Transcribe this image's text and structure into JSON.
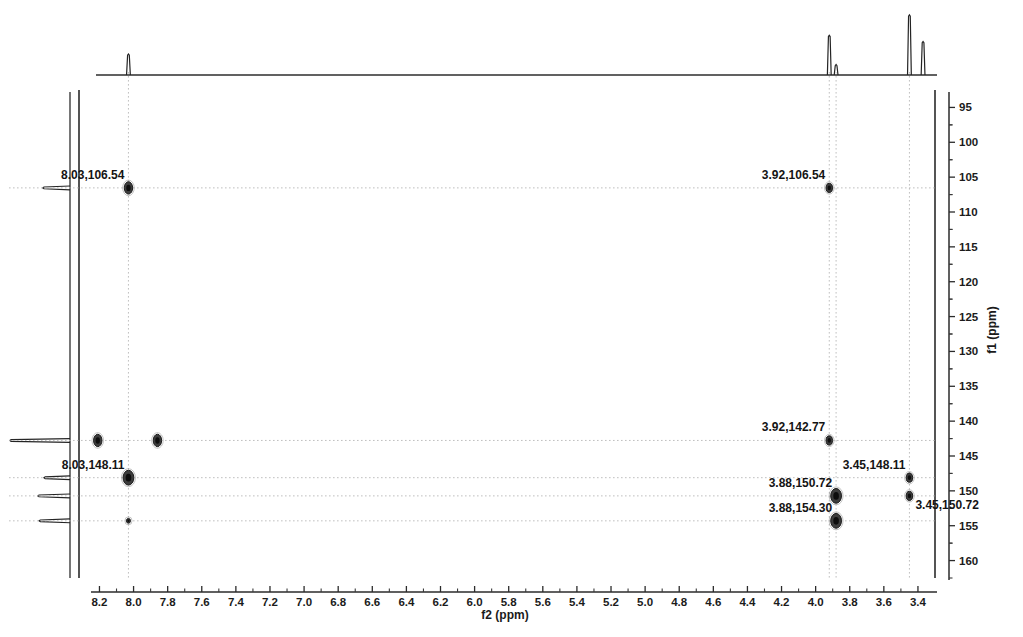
{
  "chart_data": {
    "type": "scatter",
    "title": "",
    "subtitle": "",
    "xlabel": "f2 (ppm)",
    "ylabel": "f1 (ppm)",
    "xlim": [
      8.32,
      3.3
    ],
    "ylim": [
      92.5,
      162.5
    ],
    "x_axis_direction": "reversed",
    "y_axis_direction": "reversed",
    "grid": "dotted crosshair guides at labeled peaks",
    "legend": "none",
    "x_ticks": [
      "8.2",
      "8.0",
      "7.8",
      "7.6",
      "7.4",
      "7.2",
      "7.0",
      "6.8",
      "6.6",
      "6.4",
      "6.2",
      "6.0",
      "5.8",
      "5.6",
      "5.4",
      "5.2",
      "5.0",
      "4.8",
      "4.6",
      "4.4",
      "4.2",
      "4.0",
      "3.8",
      "3.6",
      "3.4"
    ],
    "x_tick_values": [
      8.2,
      8.0,
      7.8,
      7.6,
      7.4,
      7.2,
      7.0,
      6.8,
      6.6,
      6.4,
      6.2,
      6.0,
      5.8,
      5.6,
      5.4,
      5.2,
      5.0,
      4.8,
      4.6,
      4.4,
      4.2,
      4.0,
      3.8,
      3.6,
      3.4
    ],
    "y_ticks": [
      "95",
      "100",
      "105",
      "110",
      "115",
      "120",
      "125",
      "130",
      "135",
      "140",
      "145",
      "150",
      "155",
      "160"
    ],
    "y_tick_values": [
      95,
      100,
      105,
      110,
      115,
      120,
      125,
      130,
      135,
      140,
      145,
      150,
      155,
      160
    ],
    "points": [
      {
        "x": 8.03,
        "y": 106.54,
        "label": "8.03,106.54",
        "label_side": "left-above",
        "size": "medium",
        "labeled": true
      },
      {
        "x": 3.92,
        "y": 106.54,
        "label": "3.92,106.54",
        "label_side": "left-above",
        "size": "small",
        "labeled": true
      },
      {
        "x": 8.21,
        "y": 142.77,
        "label": "",
        "label_side": "none",
        "size": "medium",
        "labeled": false
      },
      {
        "x": 7.86,
        "y": 142.77,
        "label": "",
        "label_side": "none",
        "size": "medium",
        "labeled": false
      },
      {
        "x": 3.92,
        "y": 142.77,
        "label": "3.92,142.77",
        "label_side": "left-above",
        "size": "small",
        "labeled": true
      },
      {
        "x": 8.03,
        "y": 148.11,
        "label": "8.03,148.11",
        "label_side": "left-above",
        "size": "large",
        "labeled": true
      },
      {
        "x": 3.45,
        "y": 148.11,
        "label": "3.45,148.11",
        "label_side": "left-above",
        "size": "small",
        "labeled": true
      },
      {
        "x": 3.88,
        "y": 150.72,
        "label": "3.88,150.72",
        "label_side": "left-above",
        "size": "large",
        "labeled": true
      },
      {
        "x": 3.45,
        "y": 150.72,
        "label": "3.45,150.72",
        "label_side": "right-below",
        "size": "small",
        "labeled": true
      },
      {
        "x": 3.88,
        "y": 154.3,
        "label": "3.88,154.30",
        "label_side": "left-above",
        "size": "large",
        "labeled": true
      },
      {
        "x": 8.03,
        "y": 154.3,
        "label": "",
        "label_side": "none",
        "size": "tiny",
        "labeled": false
      }
    ],
    "f2_projection_peaks": [
      {
        "ppm": 8.03,
        "height": 0.32
      },
      {
        "ppm": 3.92,
        "height": 0.62
      },
      {
        "ppm": 3.88,
        "height": 0.15
      },
      {
        "ppm": 3.45,
        "height": 0.95
      },
      {
        "ppm": 3.37,
        "height": 0.52
      }
    ],
    "f1_projection_peaks": [
      {
        "ppm": 106.54,
        "height": 0.42
      },
      {
        "ppm": 142.77,
        "height": 0.95
      },
      {
        "ppm": 148.11,
        "height": 0.4
      },
      {
        "ppm": 150.72,
        "height": 0.5
      },
      {
        "ppm": 154.3,
        "height": 0.48
      }
    ]
  },
  "axes": {
    "x_title": "f2 (ppm)",
    "y_title": "f1 (ppm)"
  }
}
